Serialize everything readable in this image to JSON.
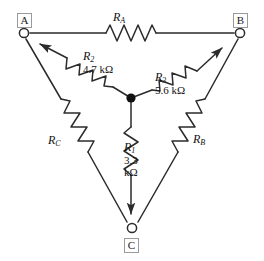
{
  "diagram": {
    "background_color": "#ffffff",
    "line_color": "#2b2b2b",
    "node_box_border_color": "#9a9a9a",
    "junction_color": "#111111"
  },
  "terminals": [
    {
      "id": "A",
      "label": "A",
      "x": 24,
      "y": 33
    },
    {
      "id": "B",
      "label": "B",
      "x": 240,
      "y": 33
    },
    {
      "id": "C",
      "label": "C",
      "x": 132,
      "y": 228
    }
  ],
  "junction": {
    "label": "center-node",
    "x": 131,
    "y": 98
  },
  "delta_resistors": [
    {
      "id": "RA",
      "name": "R",
      "subscript": "A",
      "value": "",
      "between": "A-B",
      "position": "top"
    },
    {
      "id": "RB",
      "name": "R",
      "subscript": "B",
      "value": "",
      "between": "B-C",
      "position": "right"
    },
    {
      "id": "RC",
      "name": "R",
      "subscript": "C",
      "value": "",
      "between": "A-C",
      "position": "left"
    }
  ],
  "wye_resistors": [
    {
      "id": "R2",
      "name": "R",
      "subscript": "2",
      "value": "4.7 kΩ",
      "to_terminal": "A"
    },
    {
      "id": "R3",
      "name": "R",
      "subscript": "3",
      "value": "5.6 kΩ",
      "to_terminal": "B"
    },
    {
      "id": "R1",
      "name": "R",
      "subscript": "1",
      "value_line1": "3.3",
      "value_line2": "kΩ",
      "to_terminal": "C"
    }
  ],
  "labels": {
    "ra_name": "R",
    "ra_sub": "A",
    "rb_name": "R",
    "rb_sub": "B",
    "rc_name": "R",
    "rc_sub": "C",
    "r1_name": "R",
    "r1_sub": "1",
    "r1_val1": "3.3",
    "r1_val2": "kΩ",
    "r2_name": "R",
    "r2_sub": "2",
    "r2_val": "4.7 kΩ",
    "r3_name": "R",
    "r3_sub": "3",
    "r3_val": "5.6 kΩ",
    "node_a": "A",
    "node_b": "B",
    "node_c": "C"
  }
}
